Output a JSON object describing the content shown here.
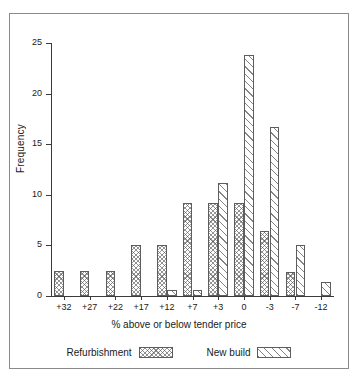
{
  "chart_data": {
    "type": "bar",
    "title": "",
    "subtitle": "",
    "xlabel": "% above or below tender price",
    "ylabel": "Frequency",
    "categories": [
      "+32",
      "+27",
      "+22",
      "+17",
      "+12",
      "+7",
      "+3",
      "0",
      "-3",
      "-7",
      "-12"
    ],
    "series": [
      {
        "name": "Refurbishment",
        "pattern": "cross-hatch",
        "values": [
          2.5,
          2.5,
          2.5,
          5.0,
          5.0,
          9.2,
          9.2,
          9.2,
          6.4,
          2.4,
          0
        ]
      },
      {
        "name": "New build",
        "pattern": "diagonal-hatch",
        "values": [
          0,
          0,
          0,
          0,
          0.6,
          0.6,
          11.2,
          23.8,
          16.7,
          5.0,
          1.4
        ]
      }
    ],
    "ylim": [
      0,
      25
    ],
    "y_ticks": [
      0,
      5,
      10,
      15,
      20,
      25
    ],
    "y_tick_labels": [
      "0",
      "5",
      "10",
      "15",
      "20",
      "25"
    ],
    "grid": false,
    "legend_position": "bottom"
  },
  "legend": {
    "items": [
      {
        "label": "Refurbishment",
        "swatch": "cross-hatch-swatch"
      },
      {
        "label": "New build",
        "swatch": "diagonal-hatch-swatch"
      }
    ]
  },
  "colors": {
    "axis": "#3a3a3a",
    "bar_outline": "#5d5d5d",
    "frame": "#8a8a8a",
    "text": "#1a1a1a",
    "background": "#ffffff"
  }
}
